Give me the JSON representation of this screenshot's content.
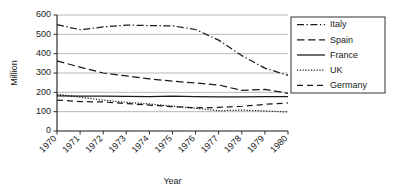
{
  "chart_data": {
    "type": "line",
    "title": "",
    "xlabel": "Year",
    "ylabel": "Million",
    "x": [
      1970,
      1971,
      1972,
      1973,
      1974,
      1975,
      1976,
      1977,
      1978,
      1979,
      1980
    ],
    "categories": [
      "1970",
      "1971",
      "1972",
      "1973",
      "1974",
      "1975",
      "1976",
      "1977",
      "1978",
      "1979",
      "1980"
    ],
    "xtick_labels": [
      "1970",
      "1971",
      "1972",
      "1973",
      "1974",
      "1975",
      "1976",
      "1977",
      "1978",
      "1979",
      "1980"
    ],
    "ytick_labels": [
      "0",
      "100",
      "200",
      "300",
      "400",
      "500",
      "600"
    ],
    "ylim": [
      0,
      600
    ],
    "ytick_step": 100,
    "grid": "horizontal",
    "legend_position": "right-outside",
    "series": [
      {
        "name": "Italy",
        "dash": "dash-dot",
        "values": [
          550,
          524,
          538,
          548,
          545,
          544,
          525,
          470,
          390,
          325,
          288
        ]
      },
      {
        "name": "Spain",
        "dash": "long-dash",
        "values": [
          363,
          330,
          300,
          285,
          270,
          258,
          248,
          238,
          210,
          215,
          195
        ]
      },
      {
        "name": "France",
        "dash": "solid",
        "values": [
          182,
          181,
          180,
          179,
          178,
          180,
          178,
          177,
          177,
          178,
          178
        ]
      },
      {
        "name": "UK",
        "dash": "dotted",
        "values": [
          190,
          175,
          160,
          148,
          140,
          128,
          118,
          105,
          108,
          104,
          98
        ]
      },
      {
        "name": "Germany",
        "dash": "dashed",
        "values": [
          160,
          152,
          150,
          142,
          134,
          126,
          120,
          122,
          128,
          138,
          145
        ]
      }
    ]
  },
  "legend": {
    "entries": [
      {
        "label": "Italy"
      },
      {
        "label": "Spain"
      },
      {
        "label": "France"
      },
      {
        "label": "UK"
      },
      {
        "label": "Germany"
      }
    ]
  },
  "colors": {
    "ink": "#1a1a1a",
    "grid": "#9a9a9a",
    "background": "#ffffff"
  }
}
